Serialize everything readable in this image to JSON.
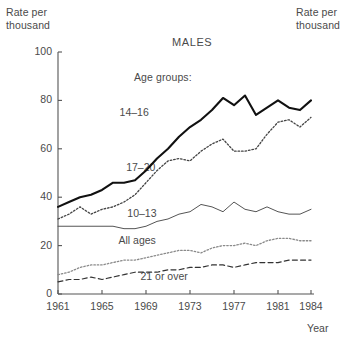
{
  "figure": {
    "title": "MALES",
    "legend_heading": "Age groups:",
    "ylabel_left_line1": "Rate per",
    "ylabel_left_line2": "thousand",
    "ylabel_right_line1": "Rate per",
    "ylabel_right_line2": "thousand",
    "xlabel": "Year"
  },
  "chart_data": {
    "type": "line",
    "title": "MALES",
    "subtitle": "Age groups:",
    "xlabel": "Year",
    "ylabel": "Rate per thousand",
    "grid": false,
    "legend_position": "inline-annotations",
    "xlim": [
      1961,
      1984
    ],
    "ylim": [
      0,
      100
    ],
    "yticks": [
      0,
      20,
      40,
      60,
      80,
      100
    ],
    "ytick_labels": [
      "0",
      "20",
      "40",
      "60",
      "80",
      "100"
    ],
    "xticks": [
      1961,
      1965,
      1969,
      1973,
      1977,
      1981,
      1984
    ],
    "xtick_labels": [
      "1961",
      "1965",
      "1969",
      "1973",
      "1977",
      "1981",
      "1984"
    ],
    "x": [
      1961,
      1962,
      1963,
      1964,
      1965,
      1966,
      1967,
      1968,
      1969,
      1970,
      1971,
      1972,
      1973,
      1974,
      1975,
      1976,
      1977,
      1978,
      1979,
      1980,
      1981,
      1982,
      1983,
      1984
    ],
    "series": [
      {
        "name": "14-16",
        "label": "14–16",
        "style": "solid-thick",
        "values": [
          36,
          38,
          40,
          41,
          43,
          46,
          46,
          47,
          51,
          56,
          60,
          65,
          69,
          72,
          76,
          81,
          78,
          82,
          74,
          77,
          80,
          77,
          76,
          80
        ]
      },
      {
        "name": "17-20",
        "label": "17–20",
        "style": "dotted",
        "values": [
          31,
          33,
          36,
          33,
          35,
          36,
          38,
          41,
          46,
          51,
          55,
          56,
          55,
          59,
          62,
          64,
          59,
          59,
          60,
          66,
          71,
          72,
          69,
          73
        ]
      },
      {
        "name": "10-13",
        "label": "10–13",
        "style": "solid-thin",
        "values": [
          28,
          28,
          28,
          28,
          28,
          28,
          27,
          27,
          28,
          30,
          31,
          33,
          34,
          37,
          36,
          34,
          38,
          35,
          34,
          36,
          34,
          33,
          33,
          35
        ]
      },
      {
        "name": "All ages",
        "label": "All ages",
        "style": "dotted",
        "values": [
          8,
          9,
          11,
          12,
          12,
          13,
          14,
          14,
          15,
          16,
          17,
          18,
          18,
          17,
          19,
          20,
          20,
          21,
          20,
          22,
          23,
          23,
          22,
          22
        ]
      },
      {
        "name": "21 or over",
        "label": "21 or over",
        "style": "dashed",
        "values": [
          5,
          6,
          6,
          7,
          6,
          7,
          8,
          9,
          9,
          9,
          10,
          10,
          11,
          11,
          12,
          12,
          11,
          12,
          13,
          13,
          13,
          14,
          14,
          14
        ]
      }
    ],
    "annotations": [
      {
        "text": "14–16",
        "x": 1966.6,
        "y": 75
      },
      {
        "text": "17–20",
        "x": 1967.2,
        "y": 52
      },
      {
        "text": "10–13",
        "x": 1967.3,
        "y": 33
      },
      {
        "text": "All ages",
        "x": 1966.5,
        "y": 22
      },
      {
        "text": "21 or over",
        "x": 1968.5,
        "y": 7
      }
    ]
  }
}
